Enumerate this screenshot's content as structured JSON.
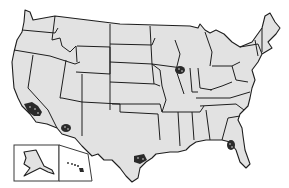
{
  "map": {
    "title": "",
    "subject": "United States map with highlighted clusters",
    "colors": {
      "land": "#e2e2e2",
      "border": "#1e1e1e",
      "highlight": "#2a2a2a",
      "background": "#ffffff"
    },
    "highlighted_regions": [
      {
        "name": "Southern California",
        "marker": "cluster-pattern"
      },
      {
        "name": "Southern Arizona",
        "marker": "cluster-pattern"
      },
      {
        "name": "Northern Illinois",
        "marker": "cluster-pattern"
      },
      {
        "name": "South Texas",
        "marker": "cluster-pattern"
      },
      {
        "name": "Central Florida",
        "marker": "cluster-pattern"
      }
    ],
    "insets": [
      {
        "name": "Alaska"
      },
      {
        "name": "Hawaii"
      }
    ]
  }
}
